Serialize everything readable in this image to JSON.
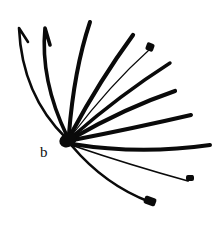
{
  "figure": {
    "panel_label": "b",
    "ink_color": "#0a0a0a",
    "background": "#ffffff",
    "hub": {
      "cx": 68,
      "cy": 140,
      "rx": 9,
      "ry": 7
    },
    "strokes": [
      {
        "id": "s1",
        "d": "M66,138 Q22,95 19,28 L28,42",
        "width": 2.6
      },
      {
        "id": "s2",
        "d": "M67,136 Q40,80 45,28 L50,45",
        "width": 3.6
      },
      {
        "id": "s3",
        "d": "M69,134 Q74,70 90,22",
        "width": 4.0
      },
      {
        "id": "s4",
        "d": "M71,134 Q100,80 133,35",
        "width": 4.2
      },
      {
        "id": "s5",
        "d": "M72,135 Q110,85 149,50",
        "width": 1.2
      },
      {
        "id": "s6",
        "d": "M73,136 Q120,95 170,63",
        "width": 3.4
      },
      {
        "id": "s7",
        "d": "M73,138 Q125,108 175,91",
        "width": 4.2
      },
      {
        "id": "s8",
        "d": "M73,140 Q135,128 191,115",
        "width": 4.0
      },
      {
        "id": "s9",
        "d": "M72,144 Q140,155 210,145",
        "width": 4.0
      },
      {
        "id": "s10",
        "d": "M74,146 Q130,165 188,181 L192,176",
        "width": 1.8
      },
      {
        "id": "s11",
        "d": "M72,146 Q105,185 150,202",
        "width": 2.6
      }
    ],
    "tip_blobs": [
      {
        "id": "b1",
        "x": 146,
        "y": 43,
        "w": 8,
        "h": 8,
        "rot": 20
      },
      {
        "id": "b2",
        "x": 186,
        "y": 175,
        "w": 8,
        "h": 6,
        "rot": 0
      },
      {
        "id": "b3",
        "x": 144,
        "y": 197,
        "w": 12,
        "h": 8,
        "rot": 20
      }
    ]
  }
}
